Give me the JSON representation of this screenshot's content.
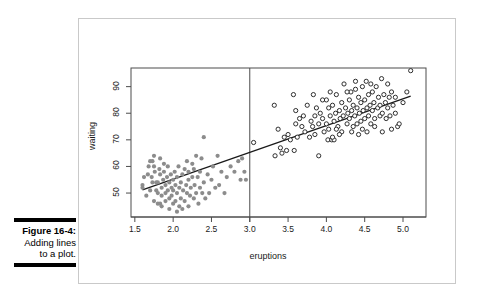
{
  "figure": {
    "number_label": "Figure 16-4:",
    "caption_lines": [
      "Adding lines",
      "to a plot."
    ]
  },
  "colors": {
    "panel_border": "#c9c9c9",
    "frame": "#4d4d4d",
    "cluster_low": "#8c8c8c",
    "cluster_high": "#1a1a1a",
    "line": "#1a1a1a",
    "background": "#ffffff",
    "text": "#1a1a1a"
  },
  "chart_data": {
    "type": "scatter",
    "title": "",
    "xlabel": "eruptions",
    "ylabel": "waiting",
    "xlim": [
      1.45,
      5.3
    ],
    "ylim": [
      41,
      97
    ],
    "xticks": [
      "1.5",
      "2.0",
      "2.5",
      "3.0",
      "3.5",
      "4.0",
      "4.5",
      "5.0"
    ],
    "xtick_values": [
      1.5,
      2.0,
      2.5,
      3.0,
      4.0,
      4.5,
      5.0,
      3.5
    ],
    "yticks": [
      "50",
      "60",
      "70",
      "80",
      "90"
    ],
    "ytick_values": [
      50,
      60,
      70,
      80,
      90
    ],
    "grid": false,
    "legend": "none",
    "annotations": [
      {
        "kind": "vline",
        "label": "vertical line at eruptions = 3.0",
        "x": 3.0
      },
      {
        "kind": "regression-line",
        "label": "fitted line",
        "x0": 1.6,
        "y0": 51.2,
        "x1": 5.1,
        "y1": 86.4
      }
    ],
    "series": [
      {
        "name": "eruptions < 3 (short eruptions)",
        "marker": "filled-circle",
        "color": "#8c8c8c",
        "points": [
          [
            1.6,
            52
          ],
          [
            1.6,
            53
          ],
          [
            1.62,
            56
          ],
          [
            1.65,
            49
          ],
          [
            1.67,
            57
          ],
          [
            1.7,
            51
          ],
          [
            1.7,
            62
          ],
          [
            1.72,
            56
          ],
          [
            1.73,
            54
          ],
          [
            1.75,
            47
          ],
          [
            1.75,
            60
          ],
          [
            1.75,
            64
          ],
          [
            1.76,
            58
          ],
          [
            1.78,
            51
          ],
          [
            1.78,
            54
          ],
          [
            1.8,
            46
          ],
          [
            1.8,
            50
          ],
          [
            1.8,
            54
          ],
          [
            1.82,
            59
          ],
          [
            1.83,
            57
          ],
          [
            1.83,
            63
          ],
          [
            1.85,
            45
          ],
          [
            1.85,
            49
          ],
          [
            1.85,
            52
          ],
          [
            1.87,
            55
          ],
          [
            1.88,
            58
          ],
          [
            1.88,
            61
          ],
          [
            1.9,
            47
          ],
          [
            1.9,
            50
          ],
          [
            1.9,
            53
          ],
          [
            1.92,
            56
          ],
          [
            1.93,
            51
          ],
          [
            1.93,
            60
          ],
          [
            1.95,
            44
          ],
          [
            1.95,
            48
          ],
          [
            1.95,
            54
          ],
          [
            1.97,
            57
          ],
          [
            1.98,
            52
          ],
          [
            1.98,
            49
          ],
          [
            2.0,
            46
          ],
          [
            2.0,
            51
          ],
          [
            2.0,
            55
          ],
          [
            2.02,
            58
          ],
          [
            2.03,
            53
          ],
          [
            2.03,
            47
          ],
          [
            2.05,
            50
          ],
          [
            2.05,
            56
          ],
          [
            2.07,
            60
          ],
          [
            2.08,
            52
          ],
          [
            2.08,
            45
          ],
          [
            2.1,
            48
          ],
          [
            2.1,
            54
          ],
          [
            2.12,
            57
          ],
          [
            2.13,
            51
          ],
          [
            2.15,
            59
          ],
          [
            2.15,
            47
          ],
          [
            2.17,
            53
          ],
          [
            2.18,
            50
          ],
          [
            2.18,
            62
          ],
          [
            2.2,
            45
          ],
          [
            2.2,
            55
          ],
          [
            2.2,
            58
          ],
          [
            2.22,
            49
          ],
          [
            2.23,
            52
          ],
          [
            2.25,
            56
          ],
          [
            2.25,
            61
          ],
          [
            2.27,
            48
          ],
          [
            2.28,
            53
          ],
          [
            2.3,
            50
          ],
          [
            2.3,
            64
          ],
          [
            2.32,
            56
          ],
          [
            2.33,
            46
          ],
          [
            2.35,
            58
          ],
          [
            2.35,
            52
          ],
          [
            2.37,
            63
          ],
          [
            2.38,
            50
          ],
          [
            2.4,
            71
          ],
          [
            2.4,
            54
          ],
          [
            2.42,
            48
          ],
          [
            2.45,
            57
          ],
          [
            2.47,
            50
          ],
          [
            2.5,
            55
          ],
          [
            2.52,
            60
          ],
          [
            2.55,
            52
          ],
          [
            2.58,
            64
          ],
          [
            2.6,
            53
          ],
          [
            2.63,
            58
          ],
          [
            2.67,
            50
          ],
          [
            2.7,
            56
          ],
          [
            2.75,
            60
          ],
          [
            2.8,
            58
          ],
          [
            2.85,
            62
          ],
          [
            2.88,
            55
          ],
          [
            2.9,
            63
          ],
          [
            2.93,
            58
          ],
          [
            2.95,
            55
          ],
          [
            1.68,
            60
          ],
          [
            1.73,
            62
          ],
          [
            2.12,
            44
          ],
          [
            2.27,
            59
          ],
          [
            1.83,
            46
          ],
          [
            2.05,
            43
          ]
        ]
      },
      {
        "name": "eruptions >= 3 (long eruptions)",
        "marker": "open-circle",
        "color": "#1a1a1a",
        "points": [
          [
            3.05,
            69
          ],
          [
            3.32,
            83
          ],
          [
            3.33,
            64
          ],
          [
            3.37,
            74
          ],
          [
            3.4,
            67
          ],
          [
            3.42,
            65
          ],
          [
            3.45,
            71
          ],
          [
            3.48,
            66
          ],
          [
            3.5,
            72
          ],
          [
            3.53,
            70
          ],
          [
            3.57,
            87
          ],
          [
            3.58,
            66
          ],
          [
            3.6,
            81
          ],
          [
            3.6,
            76
          ],
          [
            3.62,
            71
          ],
          [
            3.65,
            78
          ],
          [
            3.68,
            75
          ],
          [
            3.7,
            79
          ],
          [
            3.72,
            73
          ],
          [
            3.75,
            83
          ],
          [
            3.78,
            71
          ],
          [
            3.8,
            77
          ],
          [
            3.82,
            75
          ],
          [
            3.83,
            87
          ],
          [
            3.85,
            79
          ],
          [
            3.85,
            72
          ],
          [
            3.87,
            82
          ],
          [
            3.9,
            76
          ],
          [
            3.9,
            64
          ],
          [
            3.92,
            80
          ],
          [
            3.95,
            78
          ],
          [
            3.97,
            73
          ],
          [
            4.0,
            85
          ],
          [
            4.0,
            76
          ],
          [
            4.02,
            70
          ],
          [
            4.03,
            82
          ],
          [
            4.05,
            79
          ],
          [
            4.05,
            88
          ],
          [
            4.07,
            70
          ],
          [
            4.08,
            83
          ],
          [
            4.1,
            77
          ],
          [
            4.1,
            70
          ],
          [
            4.12,
            80
          ],
          [
            4.13,
            87
          ],
          [
            4.15,
            75
          ],
          [
            4.17,
            81
          ],
          [
            4.18,
            78
          ],
          [
            4.2,
            84
          ],
          [
            4.2,
            73
          ],
          [
            4.22,
            79
          ],
          [
            4.23,
            91
          ],
          [
            4.25,
            82
          ],
          [
            4.27,
            76
          ],
          [
            4.28,
            80
          ],
          [
            4.3,
            85
          ],
          [
            4.3,
            78
          ],
          [
            4.32,
            88
          ],
          [
            4.33,
            81
          ],
          [
            4.35,
            75
          ],
          [
            4.35,
            83
          ],
          [
            4.37,
            79
          ],
          [
            4.38,
            89
          ],
          [
            4.4,
            82
          ],
          [
            4.4,
            76
          ],
          [
            4.42,
            86
          ],
          [
            4.43,
            80
          ],
          [
            4.45,
            84
          ],
          [
            4.45,
            77
          ],
          [
            4.47,
            90
          ],
          [
            4.48,
            81
          ],
          [
            4.5,
            85
          ],
          [
            4.5,
            78
          ],
          [
            4.52,
            92
          ],
          [
            4.53,
            82
          ],
          [
            4.55,
            87
          ],
          [
            4.55,
            79
          ],
          [
            4.57,
            83
          ],
          [
            4.58,
            76
          ],
          [
            4.6,
            88
          ],
          [
            4.6,
            81
          ],
          [
            4.62,
            84
          ],
          [
            4.63,
            78
          ],
          [
            4.65,
            90
          ],
          [
            4.67,
            82
          ],
          [
            4.68,
            86
          ],
          [
            4.7,
            79
          ],
          [
            4.7,
            83
          ],
          [
            4.72,
            93
          ],
          [
            4.73,
            80
          ],
          [
            4.75,
            87
          ],
          [
            4.77,
            84
          ],
          [
            4.78,
            78
          ],
          [
            4.8,
            91
          ],
          [
            4.8,
            82
          ],
          [
            4.82,
            86
          ],
          [
            4.83,
            79
          ],
          [
            4.85,
            88
          ],
          [
            4.87,
            83
          ],
          [
            4.9,
            80
          ],
          [
            4.9,
            86
          ],
          [
            4.93,
            75
          ],
          [
            4.95,
            76
          ],
          [
            5.0,
            84
          ],
          [
            5.05,
            88
          ],
          [
            5.1,
            96
          ],
          [
            4.42,
            72
          ],
          [
            4.17,
            72
          ],
          [
            4.08,
            71
          ],
          [
            3.95,
            85
          ],
          [
            4.27,
            88
          ],
          [
            4.47,
            74
          ],
          [
            4.63,
            75
          ],
          [
            4.85,
            74
          ],
          [
            4.33,
            73
          ],
          [
            4.53,
            73
          ],
          [
            4.73,
            73
          ],
          [
            4.03,
            74
          ],
          [
            4.13,
            74
          ],
          [
            4.58,
            91
          ],
          [
            4.38,
            92
          ]
        ]
      }
    ]
  }
}
